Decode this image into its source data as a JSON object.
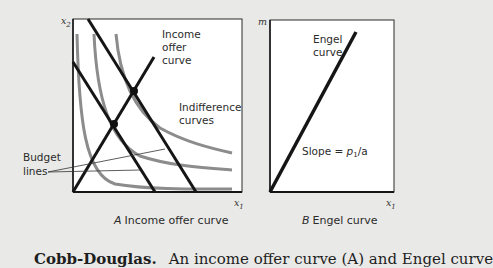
{
  "panel_a": {
    "y_axis_label": "x2",
    "x_axis_label": "x1",
    "labels": {
      "income_offer_curve_line1": "Income",
      "income_offer_curve_line2": "offer",
      "income_offer_curve_line3": "curve",
      "indifference_line1": "Indifference",
      "indifference_line2": "curves",
      "budget_line1": "Budget",
      "budget_line2": "lines"
    },
    "caption_letter": "A",
    "caption_text": "Income offer curve"
  },
  "panel_b": {
    "y_axis_label": "m",
    "x_axis_label": "x1",
    "labels": {
      "engel_line1": "Engel",
      "engel_line2": "curve",
      "slope_prefix": "Slope = ",
      "slope_p": "p",
      "slope_sub": "1",
      "slope_suffix": "/a"
    },
    "caption_letter": "B",
    "caption_text": "Engel curve"
  },
  "footer": {
    "bold": "Cobb-Douglas.",
    "text": "An income offer curve (A) and Engel curve"
  },
  "colors": {
    "background": "#e9e9e7",
    "plot_bg": "#ffffff",
    "black_lines": "#151515",
    "indifference": "#8c8c8c"
  }
}
